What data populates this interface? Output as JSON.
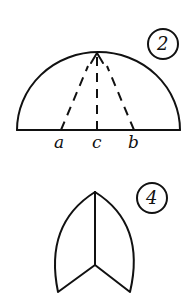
{
  "figures": [
    {
      "number": "2",
      "shape": "semicircle with dashed fold lines",
      "labels": {
        "left": "a",
        "center": "c",
        "right": "b"
      }
    },
    {
      "number": "4",
      "shape": "pointed arch (folded cone shape)"
    }
  ],
  "colors": {
    "ink": "#111111",
    "paper": "#ffffff"
  }
}
